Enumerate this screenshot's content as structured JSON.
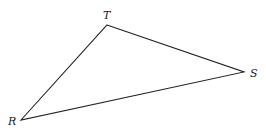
{
  "diagram": {
    "type": "triangle",
    "stroke_color": "#222222",
    "vertices": [
      {
        "name": "T",
        "x": 107,
        "y": 25,
        "label_x": 103,
        "label_y": 19
      },
      {
        "name": "S",
        "x": 244,
        "y": 72,
        "label_x": 250,
        "label_y": 77
      },
      {
        "name": "R",
        "x": 21,
        "y": 120,
        "label_x": 8,
        "label_y": 125
      }
    ],
    "edges": [
      {
        "from": "R",
        "to": "T"
      },
      {
        "from": "T",
        "to": "S"
      },
      {
        "from": "S",
        "to": "R"
      }
    ],
    "labels": {
      "T": "T",
      "S": "S",
      "R": "R"
    }
  }
}
